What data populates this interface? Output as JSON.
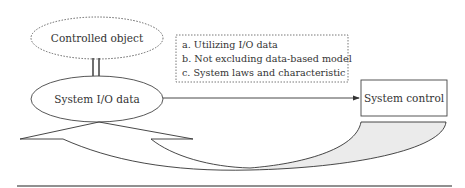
{
  "diagram": {
    "nodes": {
      "controlled_object": {
        "label": "Controlled object",
        "shape": "ellipse",
        "border": "dotted"
      },
      "system_io_data": {
        "label": "System I/O data",
        "shape": "ellipse",
        "border": "solid"
      },
      "system_control": {
        "label": "System control",
        "shape": "rectangle",
        "border": "solid"
      }
    },
    "note_box": {
      "border": "dotted",
      "items": [
        "a. Utilizing I/O data",
        "b. Not excluding data-based model",
        "c. System laws and characteristic"
      ]
    },
    "edges": [
      {
        "from": "controlled_object",
        "to": "system_io_data",
        "style": "double-line"
      },
      {
        "from": "system_io_data",
        "to": "system_control",
        "style": "arrow"
      },
      {
        "from": "system_control",
        "to": "system_io_data",
        "style": "curved-feedback-arrow"
      }
    ],
    "colors": {
      "stroke": "#333333",
      "shade": "#ebebeb",
      "background": "#ffffff"
    }
  }
}
